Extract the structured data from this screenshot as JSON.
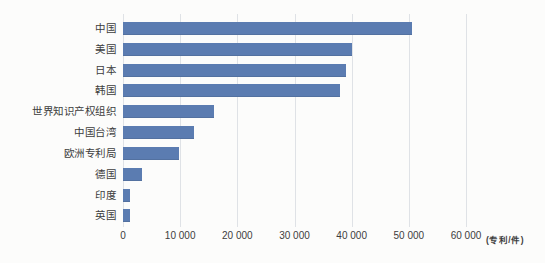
{
  "chart_data": {
    "type": "bar",
    "orientation": "horizontal",
    "title": "",
    "xlabel": "(专利/件)",
    "ylabel": "",
    "categories": [
      "中国",
      "美国",
      "日本",
      "韩国",
      "世界知识产权组织",
      "中国台湾",
      "欧洲专利局",
      "德国",
      "印度",
      "英国"
    ],
    "values": [
      50500,
      40000,
      39000,
      38000,
      15900,
      12500,
      9800,
      3400,
      1300,
      1150
    ],
    "xlim": [
      0,
      60000
    ],
    "xticks": [
      0,
      10000,
      20000,
      30000,
      40000,
      50000,
      60000
    ],
    "xtick_labels": [
      "0",
      "10 000",
      "20 000",
      "30 000",
      "40 000",
      "50 000",
      "60 000"
    ],
    "unit_label": "(专利/件)",
    "grid": "vertical",
    "legend": "none",
    "bar_color": "#5b7cb1",
    "gridline_color": "#dfe2e6",
    "text_color": "#3d3d3d"
  }
}
